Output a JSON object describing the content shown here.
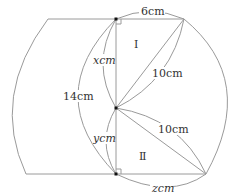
{
  "diagram": {
    "type": "geometry",
    "colors": {
      "stroke": "#9a9a9a",
      "text": "#333333",
      "point": "#111111"
    },
    "labels": {
      "top_segment": "6cm",
      "x_segment": "xcm",
      "total_height": "14cm",
      "hyp_upper": "10cm",
      "y_segment": "ycm",
      "hyp_lower": "10cm",
      "bottom_segment": "zcm",
      "region_upper": "Ⅰ",
      "region_lower": "Ⅱ"
    }
  }
}
